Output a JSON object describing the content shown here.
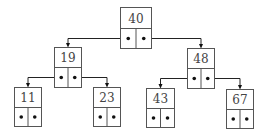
{
  "diagram": {
    "type": "binary-search-tree",
    "nodes": [
      {
        "id": "n40",
        "value": "40",
        "x": 120,
        "y": 7,
        "w": 31,
        "h": 41
      },
      {
        "id": "n19",
        "value": "19",
        "x": 54,
        "y": 47,
        "w": 27,
        "h": 40
      },
      {
        "id": "n48",
        "value": "48",
        "x": 187,
        "y": 48,
        "w": 27,
        "h": 40
      },
      {
        "id": "n11",
        "value": "11",
        "x": 14,
        "y": 87,
        "w": 27,
        "h": 39
      },
      {
        "id": "n23",
        "value": "23",
        "x": 93,
        "y": 87,
        "w": 27,
        "h": 39
      },
      {
        "id": "n43",
        "value": "43",
        "x": 146,
        "y": 88,
        "w": 28,
        "h": 39
      },
      {
        "id": "n67",
        "value": "67",
        "x": 226,
        "y": 89,
        "w": 27,
        "h": 39
      }
    ],
    "edges": [
      {
        "from": "n40",
        "side": "left",
        "to": "n19"
      },
      {
        "from": "n40",
        "side": "right",
        "to": "n48"
      },
      {
        "from": "n19",
        "side": "left",
        "to": "n11"
      },
      {
        "from": "n19",
        "side": "right",
        "to": "n23"
      },
      {
        "from": "n48",
        "side": "left",
        "to": "n43"
      },
      {
        "from": "n48",
        "side": "right",
        "to": "n67"
      }
    ]
  }
}
